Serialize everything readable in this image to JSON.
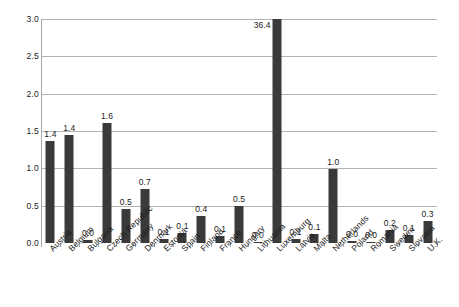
{
  "chart_data": {
    "type": "bar",
    "title": "",
    "subtitle": "",
    "xlabel": "",
    "ylabel": "",
    "ylim": [
      0.0,
      3.0
    ],
    "ytick_labels": [
      "3.0",
      "2.5",
      "2.0",
      "1.5",
      "1.0",
      "0.5",
      "0.0"
    ],
    "ytick_values": [
      3.0,
      2.5,
      2.0,
      1.5,
      1.0,
      0.5,
      0.0
    ],
    "grid": true,
    "legend": "none",
    "bar_color": "#3a3a3a",
    "gridline_color": "#b3b3b3",
    "axis_color": "#a6a6a6",
    "note": "Luxemburg bar value 36.4 exceeds the axis maximum and is clipped at the top of the plot.",
    "categories": [
      "Austria",
      "Belgium",
      "Bulgaria",
      "Czech Republic",
      "Germany",
      "Denmark",
      "Estonia",
      "Spain",
      "Finland",
      "France",
      "Hungary",
      "Lithuania",
      "Luxemburg",
      "Latvia",
      "Malta",
      "Netherlands",
      "Poland",
      "Romania",
      "Sweden",
      "Slovakia",
      "U.K."
    ],
    "values": [
      1.4,
      1.4,
      0.0,
      1.6,
      0.5,
      0.7,
      0.1,
      0.1,
      0.4,
      0.1,
      0.5,
      0.0,
      36.4,
      0.1,
      0.1,
      1.0,
      0.0,
      0.0,
      0.2,
      0.1,
      0.3
    ],
    "plotted_heights": [
      1.37,
      1.44,
      0.04,
      1.61,
      0.46,
      0.72,
      0.05,
      0.13,
      0.36,
      0.1,
      0.5,
      0.01,
      3.0,
      0.06,
      0.12,
      0.99,
      0.03,
      0.02,
      0.18,
      0.11,
      0.3
    ],
    "value_labels": [
      "1.4",
      "1.4",
      "0.0",
      "1.6",
      "0.5",
      "0.7",
      "0.1",
      "0.1",
      "0.4",
      "0.1",
      "0.5",
      "0.0",
      "36.4",
      "0.1",
      "0.1",
      "1.0",
      "0.0",
      "0.0",
      "0.2",
      "0.1",
      "0.3"
    ]
  }
}
